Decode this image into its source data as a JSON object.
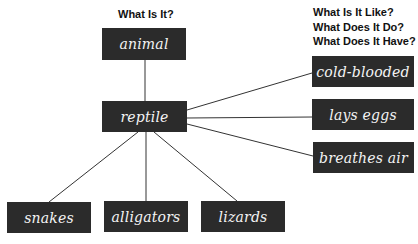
{
  "headings": {
    "left": "What Is It?",
    "right": [
      "What Is It Like?",
      "What Does It Do?",
      "What Does It Have?"
    ]
  },
  "nodes": {
    "category": "animal",
    "center": "reptile",
    "properties": [
      "cold-blooded",
      "lays eggs",
      "breathes air"
    ],
    "examples": [
      "snakes",
      "alligators",
      "lizards"
    ]
  },
  "colors": {
    "box_fill": "#2b2b2b",
    "box_text": "#f4f4f4",
    "line": "#333333",
    "background": "#ffffff"
  }
}
